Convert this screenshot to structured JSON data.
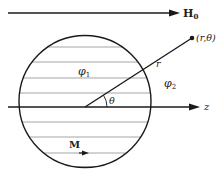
{
  "diagram": {
    "field": {
      "label": "H",
      "subscript": "0"
    },
    "axis": {
      "label": "z"
    },
    "point": {
      "label": "(r,θ)"
    },
    "radius": {
      "label": "r"
    },
    "angle": {
      "label": "θ"
    },
    "inside_potential": {
      "label": "φ",
      "subscript": "1"
    },
    "outside_potential": {
      "label": "φ",
      "subscript": "2"
    },
    "magnetization": {
      "label": "M"
    }
  },
  "colors": {
    "stroke": "#1a1a1a",
    "hatch": "#9a9a9a",
    "background": "#ffffff"
  }
}
